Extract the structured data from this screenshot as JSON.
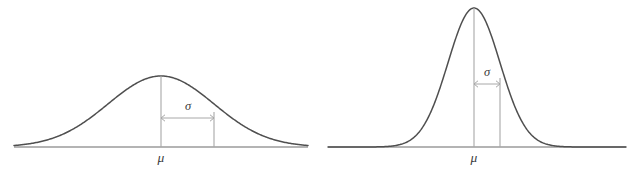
{
  "figure": {
    "title": "",
    "background_color": "#ffffff",
    "curve_color": "#4f4f4f",
    "axis_color": "#9b9b9b",
    "guide_color": "#a8a8a8",
    "label_color": "#3a3a3a"
  },
  "panels": [
    {
      "id": "left-panel",
      "name": "wide-normal-distribution",
      "mean_label": "μ",
      "sigma_label": "σ",
      "baseline_y": 147,
      "baseline_x_start": 14,
      "baseline_x_end": 308,
      "mean_x": 161,
      "peak_y": 76,
      "sigma_px": 53,
      "sigma_x": 214,
      "dim_y": 118,
      "sigma_label_x": 188,
      "sigma_label_y": 110,
      "mu_label_x": 161,
      "mu_label_y": 162
    },
    {
      "id": "right-panel",
      "name": "narrow-normal-distribution",
      "mean_label": "μ",
      "sigma_label": "σ",
      "baseline_y": 147,
      "baseline_x_start": 328,
      "baseline_x_end": 626,
      "mean_x": 474,
      "peak_y": 8,
      "sigma_px": 26,
      "sigma_x": 500,
      "dim_y": 84,
      "sigma_label_x": 487,
      "sigma_label_y": 76,
      "mu_label_x": 474,
      "mu_label_y": 162
    }
  ],
  "chart_data": {
    "type": "line",
    "xlabel": "",
    "ylabel": "",
    "grid": false,
    "legend": "none",
    "annotations": [
      {
        "panel": "left",
        "text": "μ",
        "meaning": "mean, marked by vertical line at curve peak"
      },
      {
        "panel": "left",
        "text": "σ",
        "meaning": "standard deviation, double-headed arrow from mean to inflection point"
      },
      {
        "panel": "right",
        "text": "μ",
        "meaning": "mean, marked by vertical line at curve peak"
      },
      {
        "panel": "right",
        "text": "σ",
        "meaning": "standard deviation, double-headed arrow from mean to inflection point"
      }
    ],
    "series": [
      {
        "name": "wide-normal-distribution",
        "panel": "left",
        "description": "Normal curve with large standard deviation (low, broad bell)",
        "mu": 161,
        "sigma": 53,
        "peak_height_px": 71,
        "x_range": [
          14,
          308
        ]
      },
      {
        "name": "narrow-normal-distribution",
        "panel": "right",
        "description": "Normal curve with small standard deviation (tall, narrow bell)",
        "mu": 474,
        "sigma": 26,
        "peak_height_px": 139,
        "x_range": [
          328,
          626
        ]
      }
    ]
  }
}
